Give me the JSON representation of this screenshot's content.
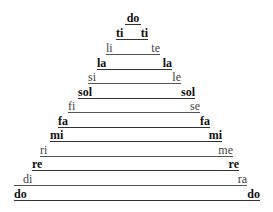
{
  "diagram": {
    "rows": [
      {
        "left": "do",
        "right": "",
        "style": "bold",
        "center": true
      },
      {
        "left": "ti",
        "right": "ti",
        "style": "bold"
      },
      {
        "left": "li",
        "right": "te",
        "style": "light"
      },
      {
        "left": "la",
        "right": "la",
        "style": "bold"
      },
      {
        "left": "si",
        "right": "le",
        "style": "light"
      },
      {
        "left": "sol",
        "right": "sol",
        "style": "bold"
      },
      {
        "left": "fi",
        "right": "se",
        "style": "light"
      },
      {
        "left": "fa",
        "right": "fa",
        "style": "bold"
      },
      {
        "left": "mi",
        "right": "mi",
        "style": "bold"
      },
      {
        "left": "ri",
        "right": "me",
        "style": "light"
      },
      {
        "left": "re",
        "right": "re",
        "style": "bold"
      },
      {
        "left": "di",
        "right": "ra",
        "style": "light"
      },
      {
        "left": "do",
        "right": "do",
        "style": "bold"
      }
    ]
  }
}
